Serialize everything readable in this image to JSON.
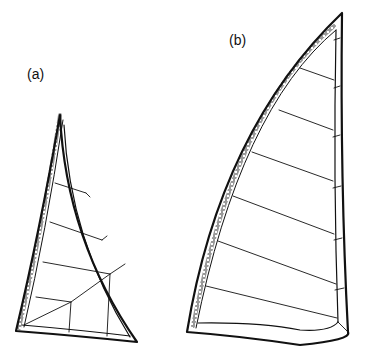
{
  "figure": {
    "panels": [
      {
        "id": "a",
        "label": "(a)",
        "description": "Smaller triangular sail with batten-style panel lines and radial seams at the foot"
      },
      {
        "id": "b",
        "label": "(b)",
        "description": "Larger sail with curved luff sleeve and parallel horizontal battens"
      }
    ],
    "colors": {
      "line": "#111111",
      "background": "#ffffff"
    }
  }
}
